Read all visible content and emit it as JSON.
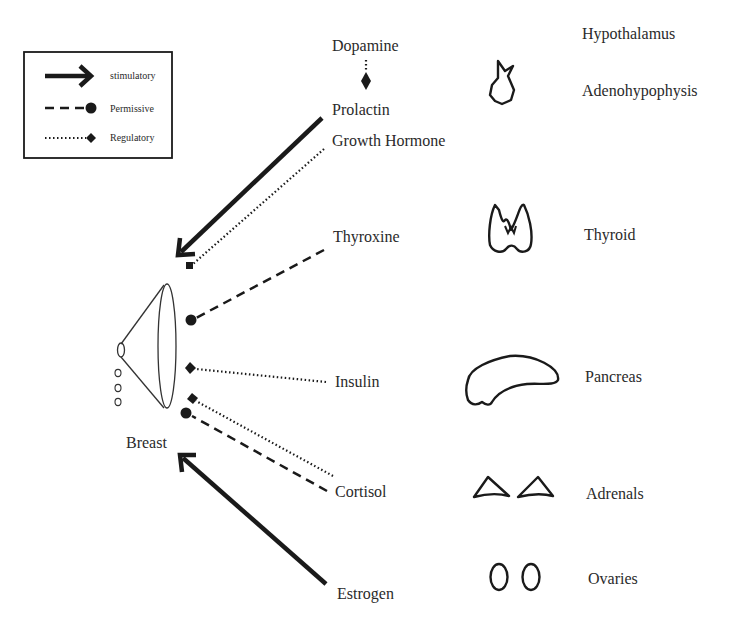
{
  "legend": {
    "items": [
      {
        "type": "stimulatory",
        "label": "stimulatory",
        "line": "solid-arrow"
      },
      {
        "type": "permissive",
        "label": "Permissive",
        "line": "dashed-circle"
      },
      {
        "type": "regulatory",
        "label": "Regulatory",
        "line": "dotted-diamond"
      }
    ]
  },
  "target": {
    "label": "Breast"
  },
  "hormones": [
    {
      "name": "Dopamine",
      "effect": "regulatory",
      "target": "Prolactin"
    },
    {
      "name": "Prolactin",
      "effect": "stimulatory",
      "target": "Breast"
    },
    {
      "name": "Growth Hormone",
      "effect": "regulatory",
      "target": "Breast"
    },
    {
      "name": "Thyroxine",
      "effect": "permissive",
      "target": "Breast"
    },
    {
      "name": "Insulin",
      "effect": "regulatory",
      "target": "Breast"
    },
    {
      "name": "Cortisol",
      "effect": "permissive+regulatory",
      "target": "Breast"
    },
    {
      "name": "Estrogen",
      "effect": "stimulatory",
      "target": "Breast"
    }
  ],
  "glands": [
    {
      "name": "Hypothalamus",
      "icon": "none"
    },
    {
      "name": "Adenohypophysis",
      "icon": "pituitary-icon"
    },
    {
      "name": "Thyroid",
      "icon": "thyroid-icon"
    },
    {
      "name": "Pancreas",
      "icon": "pancreas-icon"
    },
    {
      "name": "Adrenals",
      "icon": "adrenals-icon"
    },
    {
      "name": "Ovaries",
      "icon": "ovaries-icon"
    }
  ],
  "colors": {
    "line": "#1a1a1a",
    "text": "#2a2a2a",
    "background": "#ffffff"
  }
}
